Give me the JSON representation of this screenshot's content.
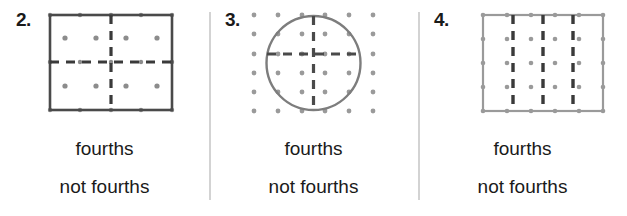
{
  "page": {
    "background_color": "#ffffff",
    "divider_color": "#d3d3d3",
    "width": 627,
    "height": 216
  },
  "problems": [
    {
      "number": "2.",
      "figure": {
        "shape_name": "rectangle-with-cross-partition",
        "outline_color": "#4a4a4a",
        "dash_color": "#3a3a3a",
        "dot_color": "#8c8c8c",
        "partition_count": 4,
        "partition_style": "cross",
        "dot_grid_cols": 5,
        "dot_grid_rows": 3
      },
      "option_fourths": "fourths",
      "option_not_fourths": "not fourths",
      "has_divider": false
    },
    {
      "number": "3.",
      "figure": {
        "shape_name": "circle-with-cross-partition",
        "outline_color": "#7d7d7d",
        "dash_color": "#4a4a4a",
        "dot_color": "#9a9a9a",
        "partition_count": 4,
        "partition_style": "cross",
        "dot_grid_cols": 6,
        "dot_grid_rows": 6
      },
      "option_fourths": "fourths",
      "option_not_fourths": "not fourths",
      "has_divider": true
    },
    {
      "number": "4.",
      "figure": {
        "shape_name": "rectangle-with-vertical-strips",
        "outline_color": "#9a9a9a",
        "dash_color": "#3a3a3a",
        "dot_color": "#9a9a9a",
        "partition_count": 4,
        "partition_style": "vertical-strips",
        "dot_grid_cols": 6,
        "dot_grid_rows": 5
      },
      "option_fourths": "fourths",
      "option_not_fourths": "not fourths",
      "has_divider": true
    }
  ]
}
